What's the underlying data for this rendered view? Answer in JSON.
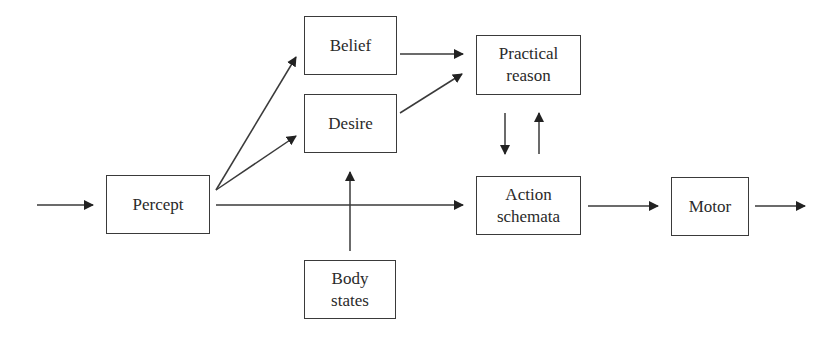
{
  "diagram": {
    "colors": {
      "stroke": "#3a3a3a",
      "text": "#2a2a2a",
      "background": "#ffffff"
    },
    "nodes": {
      "percept": {
        "line1": "Percept",
        "line2": ""
      },
      "belief": {
        "line1": "Belief",
        "line2": ""
      },
      "desire": {
        "line1": "Desire",
        "line2": ""
      },
      "practical": {
        "line1": "Practical",
        "line2": "reason"
      },
      "action": {
        "line1": "Action",
        "line2": "schemata"
      },
      "motor": {
        "line1": "Motor",
        "line2": ""
      },
      "body": {
        "line1": "Body",
        "line2": "states"
      }
    },
    "edges": [
      {
        "from": "input",
        "to": "percept"
      },
      {
        "from": "percept",
        "to": "belief"
      },
      {
        "from": "percept",
        "to": "desire"
      },
      {
        "from": "percept",
        "to": "action"
      },
      {
        "from": "belief",
        "to": "practical"
      },
      {
        "from": "desire",
        "to": "practical"
      },
      {
        "from": "practical",
        "to": "action"
      },
      {
        "from": "action",
        "to": "practical"
      },
      {
        "from": "body",
        "to": "desire"
      },
      {
        "from": "action",
        "to": "motor"
      },
      {
        "from": "motor",
        "to": "output"
      }
    ]
  }
}
